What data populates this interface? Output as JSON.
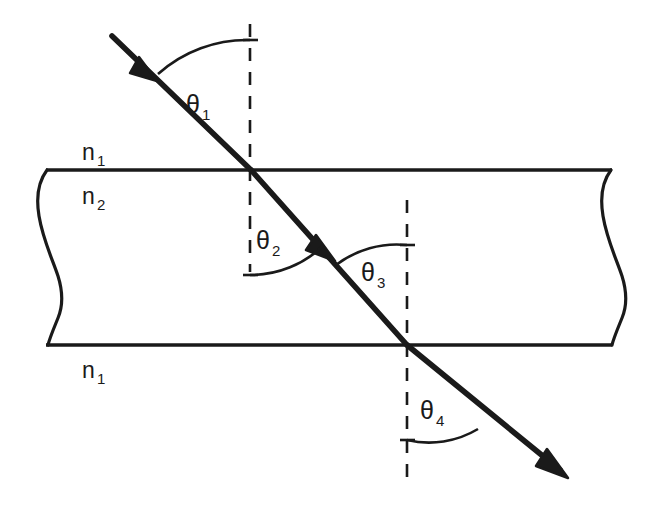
{
  "figure": {
    "background_color": "#ffffff",
    "ink_color": "#1a1a1a"
  },
  "media_labels": [
    {
      "name": "medium-above-label",
      "symbol": "n",
      "subscript": "1",
      "x": 92,
      "y": 152
    },
    {
      "name": "medium-slab-label",
      "symbol": "n",
      "subscript": "2",
      "x": 92,
      "y": 196
    },
    {
      "name": "medium-below-label",
      "symbol": "n",
      "subscript": "1",
      "x": 92,
      "y": 370
    }
  ],
  "angle_labels": [
    {
      "name": "angle-theta-1",
      "symbol": "θ",
      "subscript": "1",
      "x": 196,
      "y": 113
    },
    {
      "name": "angle-theta-2",
      "symbol": "θ",
      "subscript": "2",
      "x": 266,
      "y": 249
    },
    {
      "name": "angle-theta-3",
      "symbol": "θ",
      "subscript": "3",
      "x": 371,
      "y": 281
    },
    {
      "name": "angle-theta-4",
      "symbol": "θ",
      "subscript": "4",
      "x": 430,
      "y": 419
    }
  ],
  "slab": {
    "top_boundary_y": 170,
    "bottom_boundary_y": 345,
    "left_edge_x": 44,
    "right_edge_x": 614,
    "stroke_width": 3.2
  },
  "normals": [
    {
      "name": "normal-line-entry",
      "x": 250,
      "y_top": 24,
      "y_bottom": 272
    },
    {
      "name": "normal-line-exit",
      "x": 407,
      "y_top": 200,
      "y_bottom": 482
    }
  ],
  "ray": {
    "start": {
      "x": 112,
      "y": 36
    },
    "entry_point": {
      "x": 251,
      "y": 170
    },
    "exit_point": {
      "x": 407,
      "y": 345
    },
    "end": {
      "x": 566,
      "y": 476
    },
    "stroke_width": 5.5,
    "arrow_incident": {
      "x": 150,
      "y": 74
    },
    "arrow_internal": {
      "x": 327,
      "y": 253
    },
    "arrow_transmitted": {
      "x": 566,
      "y": 476
    }
  },
  "arcs": [
    {
      "name": "arc-theta-1",
      "center_x": 251,
      "center_y": 170,
      "radius": 133
    },
    {
      "name": "arc-theta-2",
      "center_x": 251,
      "center_y": 170,
      "radius": 105
    },
    {
      "name": "arc-theta-3",
      "center_x": 407,
      "center_y": 345,
      "radius": 100
    },
    {
      "name": "arc-theta-4",
      "center_x": 407,
      "center_y": 345,
      "radius": 95
    }
  ]
}
